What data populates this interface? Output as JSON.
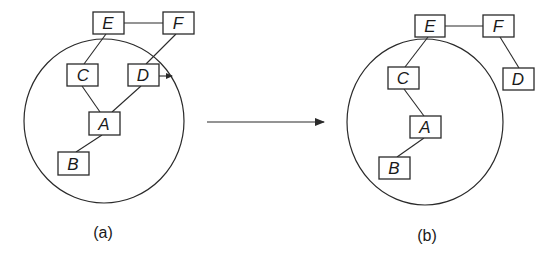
{
  "diagram": {
    "panels": [
      {
        "id": "a",
        "caption": "(a)",
        "nodes": [
          {
            "label": "E"
          },
          {
            "label": "F"
          },
          {
            "label": "C"
          },
          {
            "label": "D"
          },
          {
            "label": "A"
          },
          {
            "label": "B"
          }
        ],
        "edges": [
          [
            "E",
            "F"
          ],
          [
            "E",
            "C"
          ],
          [
            "F",
            "D"
          ],
          [
            "C",
            "A"
          ],
          [
            "D",
            "A"
          ],
          [
            "A",
            "B"
          ]
        ],
        "annotation": "D moving out of circle (small arrow)"
      },
      {
        "id": "b",
        "caption": "(b)",
        "nodes": [
          {
            "label": "E"
          },
          {
            "label": "F"
          },
          {
            "label": "C"
          },
          {
            "label": "D"
          },
          {
            "label": "A"
          },
          {
            "label": "B"
          }
        ],
        "edges": [
          [
            "E",
            "F"
          ],
          [
            "E",
            "C"
          ],
          [
            "F",
            "D"
          ],
          [
            "C",
            "A"
          ],
          [
            "A",
            "B"
          ]
        ]
      }
    ],
    "transition_arrow": "a-to-b",
    "colors": {
      "stroke": "#2a2a2a",
      "background": "#ffffff"
    }
  }
}
